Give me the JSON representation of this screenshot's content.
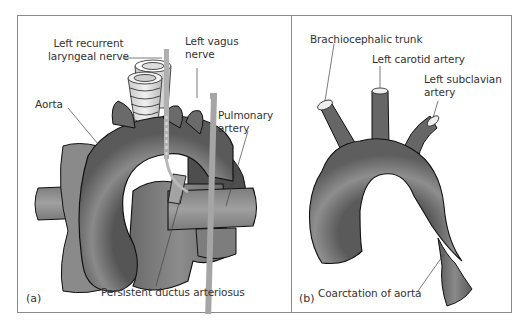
{
  "figure": {
    "panels": [
      {
        "id": "a",
        "tag": "(a)",
        "labels": {
          "left_recurrent_laryngeal_nerve_line1": "Left recurrent",
          "left_recurrent_laryngeal_nerve_line2": "laryngeal nerve",
          "left_vagus_nerve_line1": "Left vagus",
          "left_vagus_nerve_line2": "nerve",
          "aorta": "Aorta",
          "pulmonary_artery_line1": "Pulmonary",
          "pulmonary_artery_line2": "artery",
          "persistent_ductus_arteriosus": "Persistent ductus arteriosus"
        }
      },
      {
        "id": "b",
        "tag": "(b)",
        "labels": {
          "brachiocephalic_trunk": "Brachiocephalic trunk",
          "left_carotid_artery": "Left carotid artery",
          "left_subclavian_artery_line1": "Left subclavian",
          "left_subclavian_artery_line2": "artery",
          "coarctation_of_aorta": "Coarctation of aorta"
        }
      }
    ],
    "colors": {
      "frame": "#8a8a8a",
      "vessel_dark": "#5a5a5a",
      "vessel_mid": "#7a7a7a",
      "vessel_light": "#9a9a9a",
      "nerve": "#a8a8a8",
      "outline": "#1a1a1a",
      "text": "#333333"
    }
  }
}
